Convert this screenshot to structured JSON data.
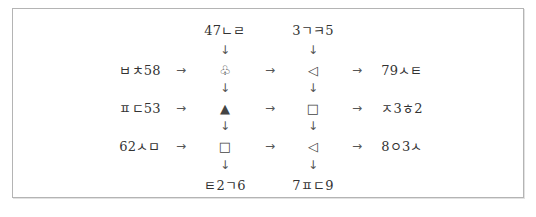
{
  "diagram": {
    "top_labels": [
      "47ㄴㄹ",
      "3ㄱㅋ5"
    ],
    "bottom_labels": [
      "ㅌ2ㄱ6",
      "7ㅍㄷ9"
    ],
    "rows": [
      {
        "left": "ㅂㅊ58",
        "symbols": [
          {
            "glyph": "♧",
            "icon": "club-outline-icon"
          },
          {
            "glyph": "◁",
            "icon": "left-triangle-outline-icon"
          }
        ],
        "right": "79ㅅㅌ"
      },
      {
        "left": "ㅍㄷ53",
        "symbols": [
          {
            "glyph": "▲",
            "icon": "up-triangle-filled-icon"
          },
          {
            "glyph": "□",
            "icon": "square-outline-icon"
          }
        ],
        "right": "ㅈ3ㅎ2"
      },
      {
        "left": "62ㅅㅁ",
        "symbols": [
          {
            "glyph": "□",
            "icon": "square-outline-icon"
          },
          {
            "glyph": "◁",
            "icon": "left-triangle-outline-icon"
          }
        ],
        "right": "8ㅇ3ㅅ"
      }
    ],
    "arrows": {
      "right": "→",
      "down": "↓"
    }
  }
}
